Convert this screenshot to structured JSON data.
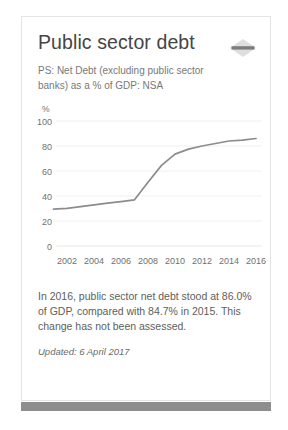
{
  "card": {
    "title": "Public sector debt",
    "subtitle": "PS: Net Debt (excluding public sector banks) as a % of GDP: NSA",
    "collapse_icon": "collapse-diamond-icon",
    "footer_text": "In 2016, public sector net debt stood at 86.0% of GDP, compared with 84.7% in 2015. This change has not been assessed.",
    "footer_updated": "Updated: 6 April 2017"
  },
  "colors": {
    "title": "#454545",
    "subtitle": "#787878",
    "line": "#8c8c8c",
    "grid": "#f0f0f0",
    "card_border": "#e4e4e4",
    "scrollbar": "#8d8d8d"
  },
  "chart_data": {
    "type": "line",
    "title": "Public sector debt",
    "subtitle": "PS: Net Debt (excluding public sector banks) as a % of GDP: NSA",
    "xlabel": "",
    "ylabel": "%",
    "ylim": [
      0,
      100
    ],
    "xlim": [
      2001,
      2016
    ],
    "yticks": [
      0,
      20,
      40,
      60,
      80,
      100
    ],
    "ytick_labels": [
      "0",
      "20",
      "40",
      "60",
      "80",
      "100"
    ],
    "xticks": [
      2002,
      2004,
      2006,
      2008,
      2010,
      2012,
      2014,
      2016
    ],
    "xtick_labels": [
      "2002",
      "2004",
      "2006",
      "2008",
      "2010",
      "2012",
      "2014",
      "2016"
    ],
    "grid": true,
    "legend": false,
    "series": [
      {
        "name": "PS: Net Debt (excluding public sector banks) as a % of GDP: NSA",
        "color": "#8c8c8c",
        "x": [
          2001,
          2002,
          2003,
          2004,
          2005,
          2006,
          2007,
          2008,
          2009,
          2010,
          2011,
          2012,
          2013,
          2014,
          2015,
          2016
        ],
        "values": [
          29.5,
          30.2,
          31.5,
          33.0,
          34.3,
          35.5,
          37.0,
          51.0,
          64.5,
          73.5,
          77.5,
          80.0,
          82.0,
          84.0,
          84.7,
          86.0
        ]
      }
    ],
    "annotations": [
      "In 2016, public sector net debt stood at 86.0% of GDP, compared with 84.7% in 2015. This change has not been assessed."
    ]
  }
}
